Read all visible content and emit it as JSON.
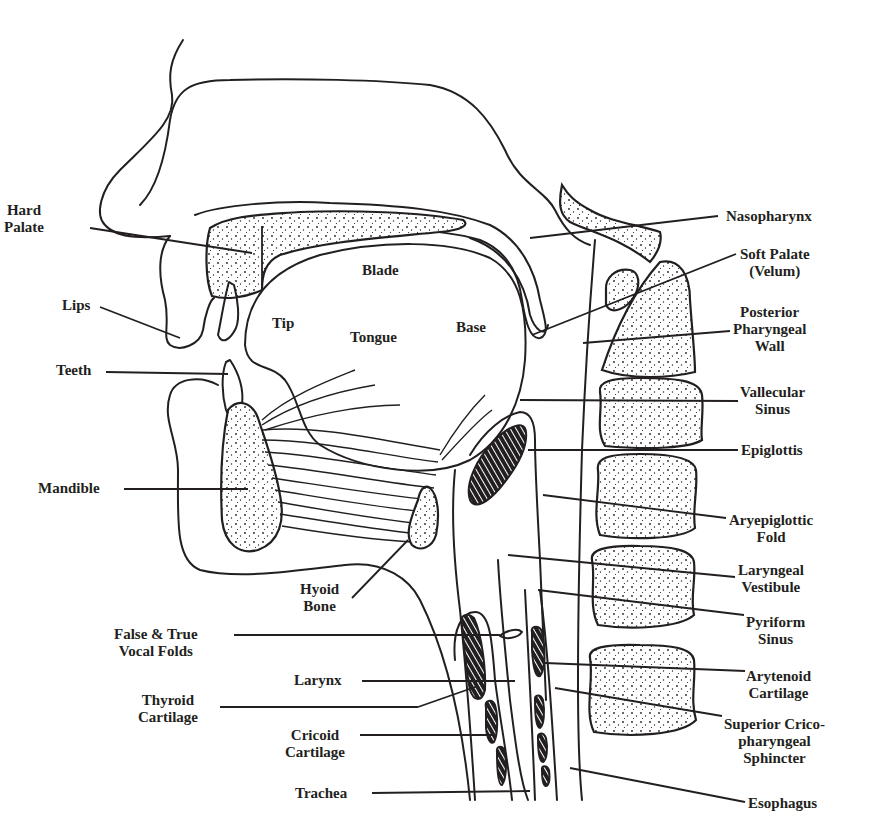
{
  "figure": {
    "ink_color": "#231f20",
    "background_color": "#ffffff"
  },
  "labels": {
    "hard_palate": "Hard\nPalate",
    "lips": "Lips",
    "teeth": "Teeth",
    "mandible": "Mandible",
    "blade": "Blade",
    "tip": "Tip",
    "tongue": "Tongue",
    "base": "Base",
    "hyoid_bone": "Hyoid\nBone",
    "false_true_vocal_folds": "False & True\nVocal Folds",
    "larynx": "Larynx",
    "thyroid_cartilage": "Thyroid\nCartilage",
    "cricoid_cartilage": "Cricoid\nCartilage",
    "trachea": "Trachea",
    "nasopharynx": "Nasopharynx",
    "soft_palate": "Soft Palate\n(Velum)",
    "posterior_pharyngeal_wall": "Posterior\nPharyngeal\nWall",
    "vallecular_sinus": "Vallecular\nSinus",
    "epiglottis": "Epiglottis",
    "aryepiglottic_fold": "Aryepiglottic\nFold",
    "laryngeal_vestibule": "Laryngeal\nVestibule",
    "pyriform_sinus": "Pyriform\nSinus",
    "arytenoid_cartilage": "Arytenoid\nCartilage",
    "superior_cricopharyngeal_sphincter": "Superior Crico-\npharyngeal\nSphincter",
    "esophagus": "Esophagus"
  }
}
